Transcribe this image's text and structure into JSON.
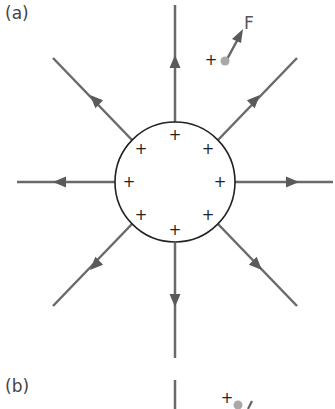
{
  "panels": [
    {
      "label": "(a)",
      "description": "Electric field lines radiating outward from a positively charged sphere"
    },
    {
      "label": "(b)",
      "description": "Second panel (partially visible)"
    }
  ],
  "force_label": "F",
  "test_charge_sign": "+",
  "surface_charge_sign": "+",
  "colors": {
    "field_line": "#666666",
    "sphere_outline": "#222222",
    "test_charge": "#a0a0a0",
    "text": "#444444"
  },
  "sphere": {
    "cx": 175,
    "cy": 182,
    "r": 60
  },
  "surface_charges": [
    {
      "x": 175,
      "y": 135
    },
    {
      "x": 208,
      "y": 149
    },
    {
      "x": 220,
      "y": 182
    },
    {
      "x": 208,
      "y": 215
    },
    {
      "x": 175,
      "y": 230
    },
    {
      "x": 141,
      "y": 215
    },
    {
      "x": 129,
      "y": 182
    },
    {
      "x": 141,
      "y": 149
    }
  ],
  "field_lines": [
    {
      "name": "up",
      "x1": 175,
      "y1": 122,
      "x2": 175,
      "y2": 5,
      "ax": 175,
      "ay": 62,
      "angle": -90
    },
    {
      "name": "up-right",
      "x1": 218,
      "y1": 140,
      "x2": 297,
      "y2": 58,
      "ax": 255,
      "ay": 100,
      "angle": -45
    },
    {
      "name": "right",
      "x1": 235,
      "y1": 182,
      "x2": 333,
      "y2": 182,
      "ax": 292,
      "ay": 182,
      "angle": 0
    },
    {
      "name": "down-right",
      "x1": 218,
      "y1": 224,
      "x2": 297,
      "y2": 306,
      "ax": 257,
      "ay": 265,
      "angle": 45
    },
    {
      "name": "down",
      "x1": 175,
      "y1": 243,
      "x2": 175,
      "y2": 358,
      "ax": 175,
      "ay": 300,
      "angle": 90
    },
    {
      "name": "down-left",
      "x1": 132,
      "y1": 224,
      "x2": 53,
      "y2": 306,
      "ax": 95,
      "ay": 265,
      "angle": 135
    },
    {
      "name": "left",
      "x1": 115,
      "y1": 182,
      "x2": 17,
      "y2": 182,
      "ax": 60,
      "ay": 182,
      "angle": 180
    },
    {
      "name": "up-left",
      "x1": 132,
      "y1": 140,
      "x2": 53,
      "y2": 58,
      "ax": 95,
      "ay": 100,
      "angle": -135
    }
  ]
}
